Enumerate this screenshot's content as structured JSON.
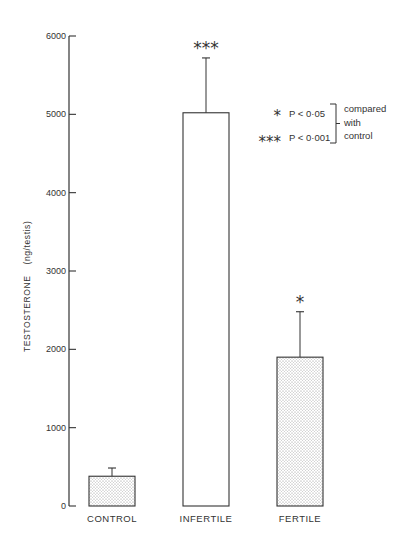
{
  "chart_data": {
    "type": "bar",
    "title": "",
    "xlabel": "",
    "ylabel": "TESTOSTERONE (ng/testis)",
    "ylabel_parts": {
      "main": "TESTOSTERONE",
      "unit": "(ng/testis)"
    },
    "ylim": [
      0,
      6000
    ],
    "yticks": [
      0,
      1000,
      2000,
      3000,
      4000,
      5000,
      6000
    ],
    "categories": [
      "CONTROL",
      "INFERTILE",
      "FERTILE"
    ],
    "values": [
      380,
      5020,
      1900
    ],
    "error_upper": [
      485,
      5720,
      2480
    ],
    "error_sem": [
      105,
      700,
      580
    ],
    "significance": [
      "",
      "***",
      "*"
    ],
    "bar_fill": [
      "stippled",
      "white",
      "stippled"
    ],
    "grid": false,
    "legend": {
      "position": "upper right",
      "entries": [
        {
          "symbol": "*",
          "text": "P < 0·05"
        },
        {
          "symbol": "***",
          "text": "P < 0·001"
        }
      ],
      "bracket_note": [
        "compared",
        "with",
        "control"
      ]
    }
  },
  "colors": {
    "ink": "#333333",
    "background": "#ffffff",
    "stipple": "#b8b8b8"
  }
}
